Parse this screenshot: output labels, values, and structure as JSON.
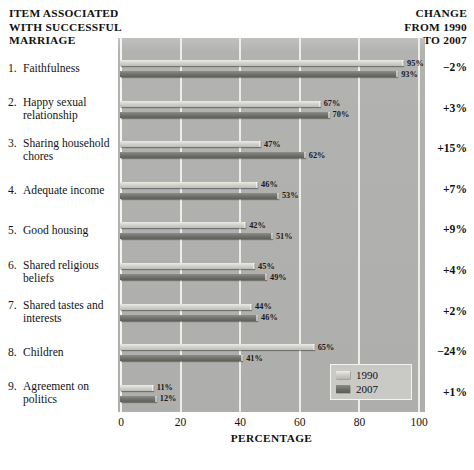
{
  "header": {
    "left_title_lines": [
      "ITEM ASSOCIATED",
      "WITH SUCCESSFUL",
      "MARRIAGE"
    ],
    "left_title": "ITEM ASSOCIATED WITH SUCCESSFUL MARRIAGE",
    "right_title_lines": [
      "CHANGE",
      "FROM 1990",
      "TO 2007"
    ],
    "right_title": "CHANGE FROM 1990 TO 2007"
  },
  "axis": {
    "title": "PERCENTAGE",
    "ticks": [
      "0",
      "20",
      "40",
      "60",
      "80",
      "100"
    ],
    "tick_values": [
      0,
      20,
      40,
      60,
      80,
      100
    ],
    "min": 0,
    "max": 100
  },
  "legend": {
    "items": [
      {
        "label": "1990",
        "swatch": "y1990"
      },
      {
        "label": "2007",
        "swatch": "y2007"
      }
    ]
  },
  "colors": {
    "plot_background": "#b4b4b2",
    "gridline": "#f2f2ef",
    "bar_1990": "#d6d4cf",
    "bar_2007": "#75756f",
    "text": "#111111",
    "page_background": "#ffffff"
  },
  "rows": [
    {
      "num": "1.",
      "label": "Faithfulness",
      "v1990": 95,
      "v2007": 93,
      "l1990": "95%",
      "l2007": "93%",
      "change": "−2%"
    },
    {
      "num": "2.",
      "label": "Happy sexual relationship",
      "v1990": 67,
      "v2007": 70,
      "l1990": "67%",
      "l2007": "70%",
      "change": "+3%"
    },
    {
      "num": "3.",
      "label": "Sharing household chores",
      "v1990": 47,
      "v2007": 62,
      "l1990": "47%",
      "l2007": "62%",
      "change": "+15%"
    },
    {
      "num": "4.",
      "label": "Adequate income",
      "v1990": 46,
      "v2007": 53,
      "l1990": "46%",
      "l2007": "53%",
      "change": "+7%"
    },
    {
      "num": "5.",
      "label": "Good housing",
      "v1990": 42,
      "v2007": 51,
      "l1990": "42%",
      "l2007": "51%",
      "change": "+9%"
    },
    {
      "num": "6.",
      "label": "Shared religious beliefs",
      "v1990": 45,
      "v2007": 49,
      "l1990": "45%",
      "l2007": "49%",
      "change": "+4%"
    },
    {
      "num": "7.",
      "label": "Shared tastes and interests",
      "v1990": 44,
      "v2007": 46,
      "l1990": "44%",
      "l2007": "46%",
      "change": "+2%"
    },
    {
      "num": "8.",
      "label": "Children",
      "v1990": 65,
      "v2007": 41,
      "l1990": "65%",
      "l2007": "41%",
      "change": "−24%"
    },
    {
      "num": "9.",
      "label": "Agreement on politics",
      "v1990": 11,
      "v2007": 12,
      "l1990": "11%",
      "l2007": "12%",
      "change": "+1%"
    }
  ],
  "chart_data": {
    "type": "bar",
    "title": "ITEM ASSOCIATED WITH SUCCESSFUL MARRIAGE",
    "orientation": "horizontal",
    "xlabel": "PERCENTAGE",
    "ylabel": "",
    "xlim": [
      0,
      100
    ],
    "xticks": [
      0,
      20,
      40,
      60,
      80,
      100
    ],
    "grid": true,
    "legend_position": "inside bottom-right",
    "categories": [
      "1. Faithfulness",
      "2. Happy sexual relationship",
      "3. Sharing household chores",
      "4. Adequate income",
      "5. Good housing",
      "6. Shared religious beliefs",
      "7. Shared tastes and interests",
      "8. Children",
      "9. Agreement on politics"
    ],
    "series": [
      {
        "name": "1990",
        "values": [
          95,
          67,
          47,
          46,
          42,
          45,
          44,
          65,
          11
        ]
      },
      {
        "name": "2007",
        "values": [
          93,
          70,
          62,
          53,
          51,
          49,
          46,
          41,
          12
        ]
      }
    ],
    "annotations": {
      "column_title": "CHANGE FROM 1990 TO 2007",
      "values": [
        "-2%",
        "+3%",
        "+15%",
        "+7%",
        "+9%",
        "+4%",
        "+2%",
        "-24%",
        "+1%"
      ]
    }
  }
}
